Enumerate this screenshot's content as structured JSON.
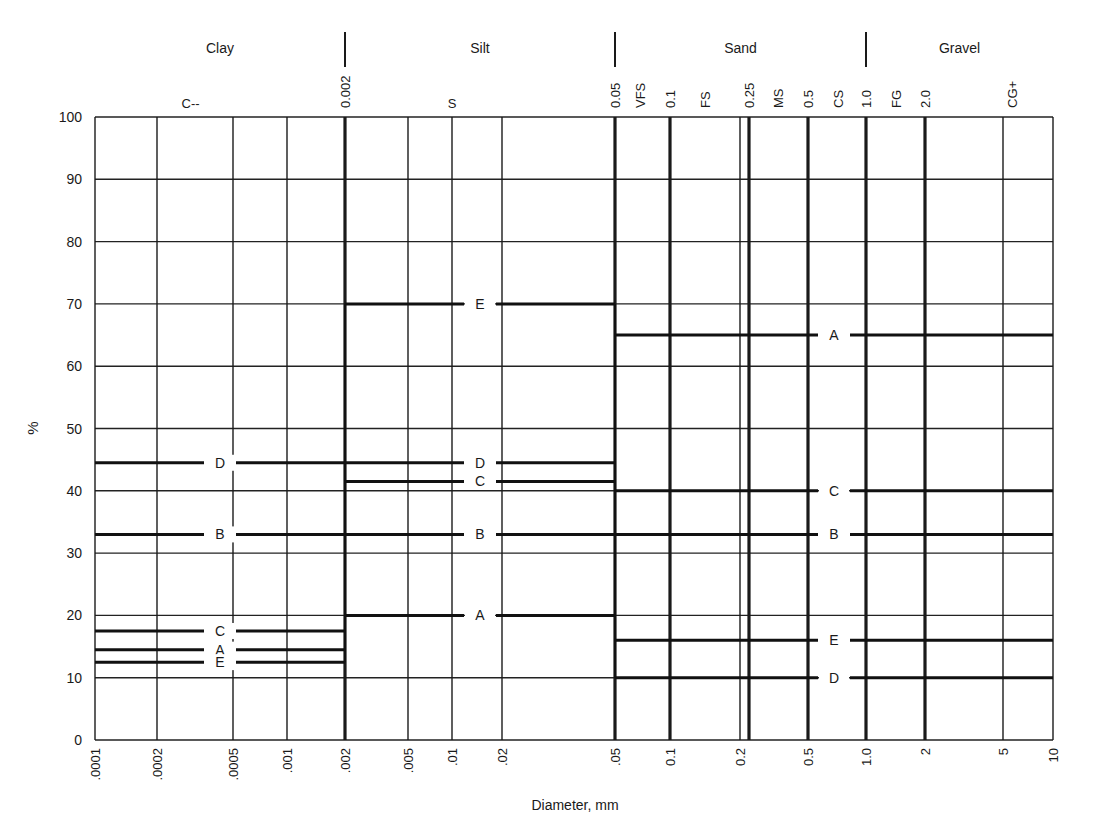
{
  "chart_data": {
    "type": "line",
    "title": "",
    "xlabel": "Diameter, mm",
    "ylabel": "%",
    "xscale": "log",
    "xlim": [
      0.0001,
      10
    ],
    "ylim": [
      0,
      100
    ],
    "grid": true,
    "y_ticks": [
      0,
      10,
      20,
      30,
      40,
      50,
      60,
      70,
      80,
      90,
      100
    ],
    "x_ticks": [
      {
        "value": 0.0001,
        "label": ".0001",
        "weight": "thin"
      },
      {
        "value": 0.0002,
        "label": ".0002",
        "weight": "thin"
      },
      {
        "value": 0.0005,
        "label": ".0005",
        "weight": "thin"
      },
      {
        "value": 0.001,
        "label": ".001",
        "weight": "thin"
      },
      {
        "value": 0.002,
        "label": ".002",
        "weight": "thick"
      },
      {
        "value": 0.005,
        "label": ".005",
        "weight": "thin"
      },
      {
        "value": 0.01,
        "label": ".01",
        "weight": "thin"
      },
      {
        "value": 0.02,
        "label": ".02",
        "weight": "thin"
      },
      {
        "value": 0.05,
        "label": ".05",
        "weight": "thick"
      },
      {
        "value": 0.1,
        "label": "0.1",
        "weight": "thick"
      },
      {
        "value": 0.2,
        "label": "0.2",
        "weight": "thin"
      },
      {
        "value": 0.25,
        "label": "",
        "weight": "thick"
      },
      {
        "value": 0.5,
        "label": "0.5",
        "weight": "thick"
      },
      {
        "value": 1.0,
        "label": "1.0",
        "weight": "thick"
      },
      {
        "value": 2,
        "label": "2",
        "weight": "thick"
      },
      {
        "value": 5,
        "label": "5",
        "weight": "thin"
      },
      {
        "value": 10,
        "label": "10",
        "weight": "thin"
      }
    ],
    "classes": [
      {
        "name": "Clay",
        "from": 0.0001,
        "to": 0.002
      },
      {
        "name": "Silt",
        "from": 0.002,
        "to": 0.05
      },
      {
        "name": "Sand",
        "from": 0.05,
        "to": 1.0
      },
      {
        "name": "Gravel",
        "from": 1.0,
        "to": 10
      }
    ],
    "class_boundaries": [
      "0.002",
      "0.05",
      "1.0"
    ],
    "subclass_labels": [
      {
        "label": "C--",
        "at": 0.0003
      },
      {
        "label": "S",
        "at": 0.01
      },
      {
        "label": "0.002",
        "at": 0.002,
        "rotated": true
      },
      {
        "label": "0.05",
        "at": 0.05,
        "rotated": true
      },
      {
        "label": "VFS",
        "at": 0.07,
        "rotated": true
      },
      {
        "label": "0.1",
        "at": 0.1,
        "rotated": true
      },
      {
        "label": "FS",
        "at": 0.16,
        "rotated": true
      },
      {
        "label": "0.25",
        "at": 0.25,
        "rotated": true
      },
      {
        "label": "MS",
        "at": 0.35,
        "rotated": true
      },
      {
        "label": "0.5",
        "at": 0.5,
        "rotated": true
      },
      {
        "label": "CS",
        "at": 0.7,
        "rotated": true
      },
      {
        "label": "1.0",
        "at": 1.0,
        "rotated": true
      },
      {
        "label": "FG",
        "at": 1.4,
        "rotated": true
      },
      {
        "label": "2.0",
        "at": 2.0,
        "rotated": true
      },
      {
        "label": "CG+",
        "at": 5.5,
        "rotated": true
      }
    ],
    "series": [
      {
        "name": "A",
        "segments": [
          {
            "from": 0.0001,
            "to": 0.002,
            "value": 14.5
          },
          {
            "from": 0.002,
            "to": 0.05,
            "value": 20
          },
          {
            "from": 0.05,
            "to": 10,
            "value": 65
          }
        ]
      },
      {
        "name": "B",
        "segments": [
          {
            "from": 0.0001,
            "to": 0.002,
            "value": 33
          },
          {
            "from": 0.002,
            "to": 0.05,
            "value": 33
          },
          {
            "from": 0.05,
            "to": 10,
            "value": 33
          }
        ]
      },
      {
        "name": "C",
        "segments": [
          {
            "from": 0.0001,
            "to": 0.002,
            "value": 17.5
          },
          {
            "from": 0.002,
            "to": 0.05,
            "value": 41.5
          },
          {
            "from": 0.05,
            "to": 10,
            "value": 40
          }
        ]
      },
      {
        "name": "D",
        "segments": [
          {
            "from": 0.0001,
            "to": 0.002,
            "value": 44.5
          },
          {
            "from": 0.002,
            "to": 0.05,
            "value": 44.5
          },
          {
            "from": 0.05,
            "to": 10,
            "value": 10
          }
        ]
      },
      {
        "name": "E",
        "segments": [
          {
            "from": 0.0001,
            "to": 0.002,
            "value": 12.5
          },
          {
            "from": 0.002,
            "to": 0.05,
            "value": 70
          },
          {
            "from": 0.05,
            "to": 10,
            "value": 16
          }
        ]
      }
    ]
  },
  "labels": {
    "xlabel": "Diameter, mm",
    "ylabel": "%"
  }
}
